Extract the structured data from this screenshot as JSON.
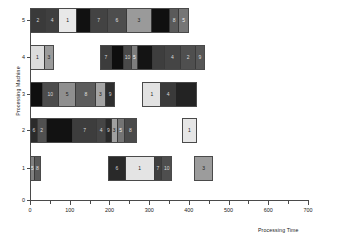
{
  "chart_data": {
    "type": "bar",
    "subtype": "gantt",
    "title": "",
    "xlabel": "Processing Time",
    "ylabel": "Processing Machine",
    "xlim": [
      0,
      700
    ],
    "ylim": [
      0,
      5.6
    ],
    "grid": false,
    "legend": null,
    "xticks": [
      0,
      100,
      200,
      300,
      400,
      500,
      600,
      700
    ],
    "xtick_labels": [
      "0",
      "100",
      "200",
      "300",
      "400",
      "500",
      "600",
      "700"
    ],
    "xminor_ticks": [
      50,
      150,
      250,
      350,
      450,
      550,
      650
    ],
    "yticks": [
      0,
      1,
      2,
      3,
      4,
      5
    ],
    "ytick_labels": [
      "0",
      "1",
      "2",
      "3",
      "4",
      "5"
    ],
    "machines": [
      {
        "machine": 5,
        "tasks": [
          {
            "label": "2",
            "start": 0,
            "end": 38,
            "color": "#3a3a3a",
            "text_color": "#d8d8d8"
          },
          {
            "label": "4",
            "start": 38,
            "end": 72,
            "color": "#3f3f3f",
            "text_color": "#d8d8d8"
          },
          {
            "label": "1",
            "start": 72,
            "end": 118,
            "color": "#e8e8e8",
            "text_color": "#222222"
          },
          {
            "label": "",
            "start": 118,
            "end": 152,
            "color": "#111111",
            "text_color": "#dddddd"
          },
          {
            "label": "7",
            "start": 152,
            "end": 196,
            "color": "#434343",
            "text_color": "#d8d8d8"
          },
          {
            "label": "6",
            "start": 196,
            "end": 245,
            "color": "#4d4d4d",
            "text_color": "#e0e0e0"
          },
          {
            "label": "3",
            "start": 245,
            "end": 308,
            "color": "#9a9a9a",
            "text_color": "#1a1a1a"
          },
          {
            "label": "",
            "start": 308,
            "end": 355,
            "color": "#101010",
            "text_color": "#dddddd"
          },
          {
            "label": "8",
            "start": 355,
            "end": 378,
            "color": "#5a5a5a",
            "text_color": "#e0e0e0"
          },
          {
            "label": "5",
            "start": 378,
            "end": 400,
            "color": "#767676",
            "text_color": "#f0f0f0"
          }
        ]
      },
      {
        "machine": 4,
        "tasks": [
          {
            "label": "1",
            "start": 0,
            "end": 38,
            "color": "#dcdcdc",
            "text_color": "#222222"
          },
          {
            "label": "3",
            "start": 38,
            "end": 60,
            "color": "#9b9b9b",
            "text_color": "#1a1a1a"
          }
        ],
        "tasks2": [
          {
            "label": "7",
            "start": 175,
            "end": 205,
            "color": "#3c3c3c",
            "text_color": "#d8d8d8"
          },
          {
            "label": "",
            "start": 205,
            "end": 236,
            "color": "#0e0e0e",
            "text_color": "#dddddd"
          },
          {
            "label": "10",
            "start": 236,
            "end": 255,
            "color": "#494949",
            "text_color": "#dadada"
          },
          {
            "label": "5",
            "start": 255,
            "end": 272,
            "color": "#7d7d7d",
            "text_color": "#f0f0f0"
          },
          {
            "label": "",
            "start": 272,
            "end": 310,
            "color": "#141414",
            "text_color": "#dddddd"
          },
          {
            "label": "",
            "start": 310,
            "end": 340,
            "color": "#3e3e3e",
            "text_color": "#dddddd"
          },
          {
            "label": "4",
            "start": 340,
            "end": 382,
            "color": "#454545",
            "text_color": "#d8d8d8"
          },
          {
            "label": "2",
            "start": 382,
            "end": 420,
            "color": "#4f4f4f",
            "text_color": "#dadada"
          },
          {
            "label": "9",
            "start": 420,
            "end": 440,
            "color": "#565656",
            "text_color": "#dadada"
          }
        ]
      },
      {
        "machine": 3,
        "tasks": [
          {
            "label": "",
            "start": 0,
            "end": 30,
            "color": "#0f0f0f",
            "text_color": "#dddddd"
          },
          {
            "label": "10",
            "start": 30,
            "end": 72,
            "color": "#4c4c4c",
            "text_color": "#dadada"
          },
          {
            "label": "5",
            "start": 72,
            "end": 117,
            "color": "#8f8f8f",
            "text_color": "#1a1a1a"
          },
          {
            "label": "8",
            "start": 117,
            "end": 168,
            "color": "#5c5c5c",
            "text_color": "#e0e0e0"
          },
          {
            "label": "3",
            "start": 168,
            "end": 193,
            "color": "#a4a4a4",
            "text_color": "#1a1a1a"
          },
          {
            "label": "9",
            "start": 193,
            "end": 215,
            "color": "#2e2e2e",
            "text_color": "#d0d0d0"
          }
        ],
        "tasks2": [
          {
            "label": "1",
            "start": 283,
            "end": 330,
            "color": "#e2e2e2",
            "text_color": "#222222"
          },
          {
            "label": "4",
            "start": 330,
            "end": 368,
            "color": "#3a3a3a",
            "text_color": "#d8d8d8"
          },
          {
            "label": "",
            "start": 368,
            "end": 420,
            "color": "#232323",
            "text_color": "#dddddd"
          }
        ]
      },
      {
        "machine": 2,
        "tasks": [
          {
            "label": "6",
            "start": 0,
            "end": 17,
            "color": "#2b2b2b",
            "text_color": "#d0d0d0"
          },
          {
            "label": "2",
            "start": 17,
            "end": 40,
            "color": "#505050",
            "text_color": "#dadada"
          },
          {
            "label": "",
            "start": 40,
            "end": 108,
            "color": "#121212",
            "text_color": "#dddddd"
          },
          {
            "label": "7",
            "start": 108,
            "end": 170,
            "color": "#3d3d3d",
            "text_color": "#d8d8d8"
          },
          {
            "label": "4",
            "start": 170,
            "end": 193,
            "color": "#454545",
            "text_color": "#d8d8d8"
          },
          {
            "label": "9",
            "start": 193,
            "end": 207,
            "color": "#2a2a2a",
            "text_color": "#d0d0d0"
          },
          {
            "label": "3",
            "start": 207,
            "end": 222,
            "color": "#a0a0a0",
            "text_color": "#1a1a1a"
          },
          {
            "label": "5",
            "start": 222,
            "end": 240,
            "color": "#747474",
            "text_color": "#f0f0f0"
          },
          {
            "label": "8",
            "start": 240,
            "end": 270,
            "color": "#4a4a4a",
            "text_color": "#dadada"
          }
        ],
        "tasks2": [
          {
            "label": "1",
            "start": 383,
            "end": 420,
            "color": "#e6e6e6",
            "text_color": "#222222"
          }
        ]
      },
      {
        "machine": 1,
        "tasks": [
          {
            "label": "5",
            "start": 0,
            "end": 12,
            "color": "#808080",
            "text_color": "#f0f0f0"
          },
          {
            "label": "8",
            "start": 12,
            "end": 27,
            "color": "#5a5a5a",
            "text_color": "#e0e0e0"
          }
        ],
        "tasks2": [
          {
            "label": "6",
            "start": 197,
            "end": 240,
            "color": "#292929",
            "text_color": "#d0d0d0"
          },
          {
            "label": "1",
            "start": 240,
            "end": 315,
            "color": "#e4e4e4",
            "text_color": "#222222"
          },
          {
            "label": "7",
            "start": 315,
            "end": 335,
            "color": "#3f3f3f",
            "text_color": "#d8d8d8"
          },
          {
            "label": "10",
            "start": 335,
            "end": 358,
            "color": "#4e4e4e",
            "text_color": "#dadada"
          }
        ],
        "tasks3": [
          {
            "label": "3",
            "start": 412,
            "end": 462,
            "color": "#9c9c9c",
            "text_color": "#1a1a1a"
          }
        ]
      }
    ]
  },
  "axes": {
    "x_label_text": "Processing Time",
    "y_label_text": "Processing Machine"
  }
}
